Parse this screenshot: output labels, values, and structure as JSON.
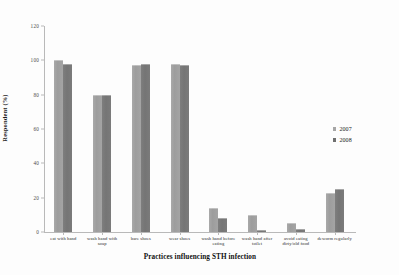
{
  "chart_data": {
    "type": "bar",
    "title": "",
    "xlabel": "Practices influencing STH infection",
    "ylabel": "Respondent (%)",
    "ylim": [
      0,
      120
    ],
    "yticks": [
      0,
      20,
      40,
      60,
      80,
      100,
      120
    ],
    "grid": false,
    "legend_position": "right",
    "categories": [
      "eat with hand",
      "wash hand with soap",
      "bare shoes",
      "wear shoes",
      "wash hand before eating",
      "wash hand after toilet",
      "avoid eating dirty/old food",
      "deworm regularly"
    ],
    "series": [
      {
        "name": "2007",
        "color": "#a6a6a6",
        "values": [
          100,
          80,
          97,
          98,
          14,
          10,
          5,
          23
        ]
      },
      {
        "name": "2008",
        "color": "#6f6f6f",
        "values": [
          98,
          80,
          98,
          97,
          8,
          1,
          2,
          25
        ]
      }
    ]
  }
}
